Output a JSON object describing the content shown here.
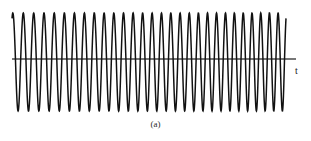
{
  "figure": {
    "caption": "(a)",
    "axis_label_t": "t",
    "background_color": "#ffffff",
    "trace_color": "#111111",
    "axis_color": "#4a4a4a"
  },
  "chart_data": {
    "type": "line",
    "title": "",
    "subtitle": "",
    "xlabel": "t",
    "ylabel": "",
    "grid": false,
    "legend": null,
    "annotations": [
      "(a)"
    ],
    "xlim": [
      0,
      1
    ],
    "ylim": [
      -1.08,
      1.08
    ],
    "axis_y_value": 0,
    "amplitude": 1.0,
    "cycles_total": 29,
    "start_phase_deg": 62,
    "frequency_start_cycles_per_unit": 26.0,
    "frequency_end_cycles_per_unit": 32.0,
    "x_start": 0.0,
    "x_end": 1.0,
    "samples": 1400,
    "peak_values": [
      1.0,
      1.0,
      1.0,
      1.0,
      1.0,
      1.0,
      1.0,
      1.0,
      1.0,
      1.0,
      1.0,
      1.0,
      1.0,
      1.0,
      1.0,
      1.0,
      1.0,
      1.0,
      1.0,
      1.0,
      1.0,
      1.0,
      1.0,
      1.0,
      1.0,
      1.0,
      1.0,
      1.0,
      1.0
    ],
    "trough_values": [
      -1.0,
      -1.0,
      -1.0,
      -1.0,
      -1.0,
      -1.0,
      -1.0,
      -1.0,
      -1.0,
      -1.0,
      -1.0,
      -1.0,
      -1.0,
      -1.0,
      -1.0,
      -1.0,
      -1.0,
      -1.0,
      -1.0,
      -1.0,
      -1.0,
      -1.0,
      -1.0,
      -1.0,
      -1.0,
      -1.0,
      -1.0,
      -1.0,
      -1.0
    ],
    "axis_range_x_px": [
      12,
      296
    ],
    "axis_y_px": 59,
    "trace_top_px": 13,
    "trace_bottom_px": 111
  }
}
